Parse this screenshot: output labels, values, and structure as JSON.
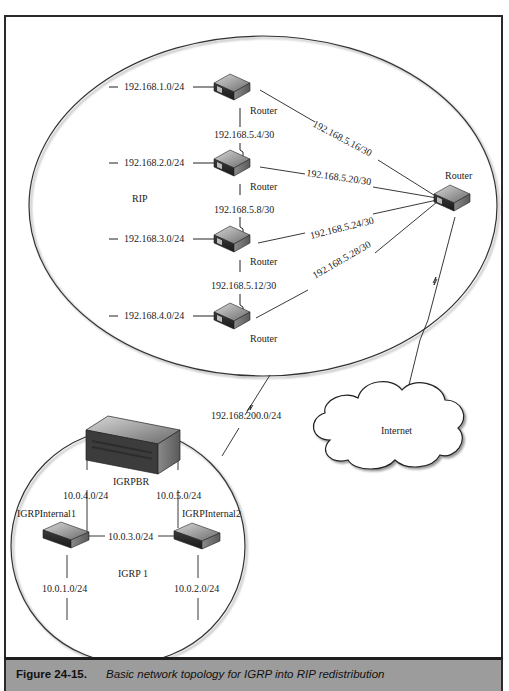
{
  "caption": {
    "label": "Figure 24-15.",
    "text": "Basic network topology for IGRP into RIP redistribution"
  },
  "rip_domain": {
    "label": "RIP",
    "routers": [
      {
        "label": "Router",
        "lan": "192.168.1.0/24"
      },
      {
        "label": "Router",
        "lan": "192.168.2.0/24"
      },
      {
        "label": "Router",
        "lan": "192.168.3.0/24"
      },
      {
        "label": "Router",
        "lan": "192.168.4.0/24"
      }
    ],
    "vertical_links": [
      "192.168.5.4/30",
      "192.168.5.8/30",
      "192.168.5.12/30"
    ],
    "hub_router": {
      "label": "Router"
    },
    "hub_links": [
      "192.168.5.16/30",
      "192.168.5.20/30",
      "192.168.5.24/30",
      "192.168.5.28/30"
    ]
  },
  "wan_link": {
    "label": "192.168.200.0/24"
  },
  "internet": {
    "label": "Internet"
  },
  "igrp_domain": {
    "label": "IGRP 1",
    "border_router": {
      "label": "IGRPBR"
    },
    "internal1": {
      "label": "IGRPInternal1",
      "lan": "10.0.1.0/24"
    },
    "internal2": {
      "label": "IGRPInternal2",
      "lan": "10.0.2.0/24"
    },
    "links": {
      "br_to_int1": "10.0.4.0/24",
      "br_to_int2": "10.0.5.0/24",
      "int1_to_int2": "10.0.3.0/24"
    }
  }
}
